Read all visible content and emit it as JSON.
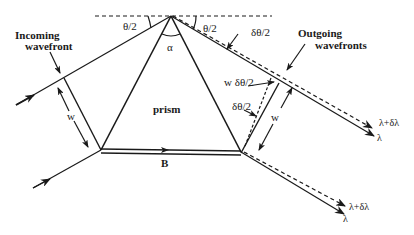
{
  "diagram": {
    "labels": {
      "incoming_line1": "Incoming",
      "incoming_line2": "wavefront",
      "outgoing_line1": "Outgoing",
      "outgoing_line2": "wavefronts",
      "theta_half_left": "θ/2",
      "theta_half_right": "θ/2",
      "alpha": "α",
      "delta_theta_half_top": "δθ/2",
      "w_delta_theta_half": "w δθ/2",
      "delta_theta_half_mid": "δθ/2",
      "prism": "prism",
      "base": "B",
      "w_left": "w",
      "w_right": "w",
      "lambda_plus_top": "λ+δλ",
      "lambda_top": "λ",
      "lambda_plus_bottom": "λ+δλ",
      "lambda_bottom": "λ"
    },
    "colors": {
      "line": "#1a1a1a",
      "background": "#ffffff"
    }
  }
}
